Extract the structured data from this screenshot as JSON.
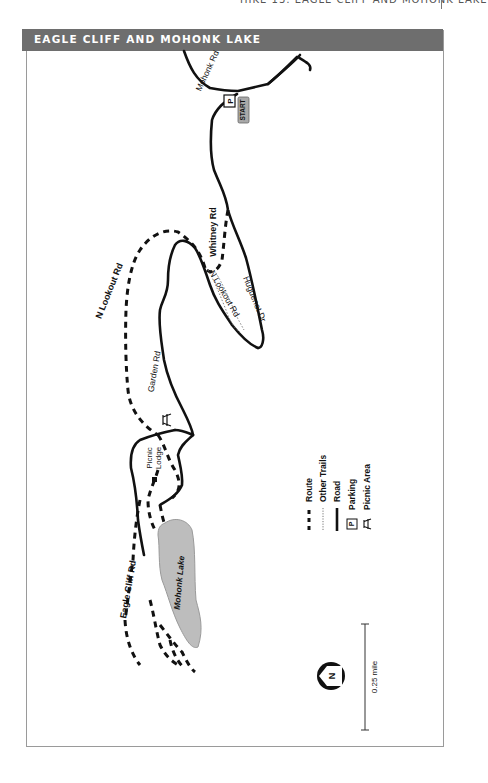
{
  "running_head": "HIKE 13: EAGLE CLIFF AND MOHONK LAKE",
  "map": {
    "title": "EAGLE CLIFF AND MOHONK LAKE",
    "labels": {
      "mohonk_rd": "Mohonk Rd",
      "start": "START",
      "parking_symbol": "P",
      "whitney_rd": "Whitney Rd",
      "n_lookout_rd_inner": "N Lookout Rd",
      "huguenot_dr": "Huguenot Dr",
      "n_lookout_rd_outer": "N Lookout Rd",
      "garden_rd": "Garden Rd",
      "picnic_lodge": "Picnic Lodge",
      "picnic_lodge_line1": "Picnic",
      "picnic_lodge_line2": "Lodge",
      "eagle_cliff_rd": "Eagle Cliff Rd",
      "mohonk_lake": "Mohonk Lake"
    },
    "legend": [
      {
        "symbol": "dashed-thick",
        "label": "Route"
      },
      {
        "symbol": "dotted-thin",
        "label": "Other Trails"
      },
      {
        "symbol": "solid",
        "label": "Road"
      },
      {
        "symbol": "parking-box",
        "label": "Parking"
      },
      {
        "symbol": "picnic-table",
        "label": "Picnic Area"
      }
    ],
    "north_arrow": "N",
    "scale": "0.25 mile",
    "colors": {
      "banner": "#6e6e6e",
      "lake": "#bdbdbd",
      "road": "#111111",
      "start_badge": "#a9a9a9"
    }
  }
}
